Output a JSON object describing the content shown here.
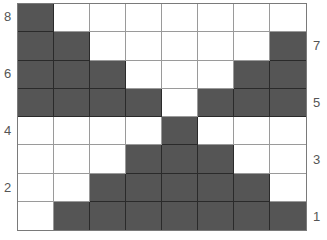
{
  "colors": {
    "filled": "#555555",
    "empty": "#ffffff",
    "grid_line": "#9a9a9a",
    "label": "#555555"
  },
  "grid": {
    "rows": 8,
    "cols": 8,
    "cells": [
      [
        1,
        0,
        0,
        0,
        0,
        0,
        0,
        0
      ],
      [
        1,
        1,
        0,
        0,
        0,
        0,
        0,
        1
      ],
      [
        1,
        1,
        1,
        0,
        0,
        0,
        1,
        1
      ],
      [
        1,
        1,
        1,
        1,
        0,
        1,
        1,
        1
      ],
      [
        0,
        0,
        0,
        0,
        1,
        0,
        0,
        0
      ],
      [
        0,
        0,
        0,
        1,
        1,
        1,
        0,
        0
      ],
      [
        0,
        0,
        1,
        1,
        1,
        1,
        1,
        0
      ],
      [
        0,
        1,
        1,
        1,
        1,
        1,
        1,
        1
      ]
    ]
  },
  "labels": {
    "left": [
      {
        "text": "8",
        "row": 1
      },
      {
        "text": "6",
        "row": 3
      },
      {
        "text": "4",
        "row": 5
      },
      {
        "text": "2",
        "row": 7
      }
    ],
    "right": [
      {
        "text": "7",
        "row": 2
      },
      {
        "text": "5",
        "row": 4
      },
      {
        "text": "3",
        "row": 6
      },
      {
        "text": "1",
        "row": 8
      }
    ]
  }
}
